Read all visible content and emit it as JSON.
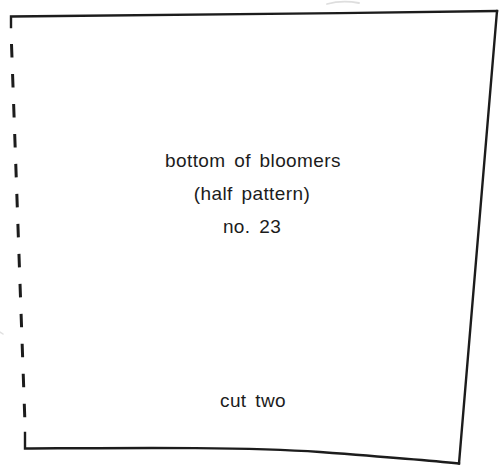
{
  "diagram": {
    "title": "bottom of bloomers",
    "subtitle": "(half pattern)",
    "piece_number": "no. 23",
    "cutting_instruction": "cut two"
  },
  "icons": {
    "fold_line": "dashed-fold-line"
  },
  "colors": {
    "ink": "#1c1c1c",
    "paper": "#ffffff",
    "faint_artifact": "#cccccc"
  }
}
